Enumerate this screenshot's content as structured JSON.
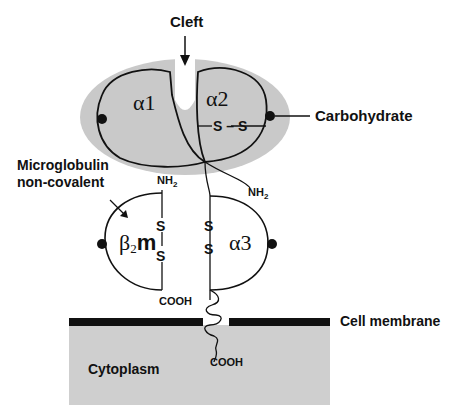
{
  "labels": {
    "cleft": "Cleft",
    "alpha1": "α1",
    "alpha2": "α2",
    "carbohydrate": "Carbohydrate",
    "microglobulin_line1": "Microglobulin",
    "microglobulin_line2": "non-covalent",
    "b2m_beta": "β",
    "b2m_sub": "2",
    "b2m_m": "m",
    "alpha3": "α3",
    "nh2_b2m": "NH",
    "nh2_b2m_sub": "2",
    "nh2_chain": "NH",
    "nh2_chain_sub": "2",
    "cooh_b2m": "COOH",
    "cooh_tail": "COOH",
    "cell_membrane": "Cell membrane",
    "cytoplasm": "Cytoplasm",
    "ss_alpha2": "S – S",
    "s": "S"
  },
  "colors": {
    "domain_fill": "#c9c9c9",
    "cytoplasm_fill": "#cfcfcf",
    "membrane": "#111111",
    "line": "#111111"
  }
}
